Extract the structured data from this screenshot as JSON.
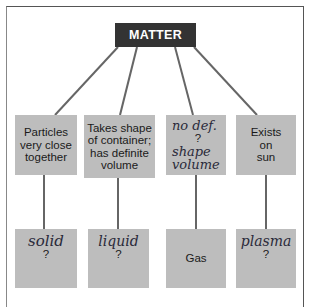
{
  "title": "MATTER",
  "colors": {
    "root_fill": "#333333",
    "root_text": "#ffffff",
    "box_fill": "#bdbdbd",
    "line": "#666666"
  },
  "properties": [
    {
      "printed": [
        "Particles",
        "very close",
        "together"
      ]
    },
    {
      "printed": [
        "Takes shape",
        "of container;",
        "has definite",
        "volume"
      ]
    },
    {
      "handwritten": [
        "no def.",
        "shape",
        "volume"
      ],
      "question": "?"
    },
    {
      "printed": [
        "Exists",
        "on",
        "sun"
      ]
    }
  ],
  "states": [
    {
      "handwritten": "solid",
      "question": "?"
    },
    {
      "handwritten": "liquid",
      "question": "?"
    },
    {
      "printed": "Gas"
    },
    {
      "handwritten": "plasma",
      "question": "?"
    }
  ]
}
